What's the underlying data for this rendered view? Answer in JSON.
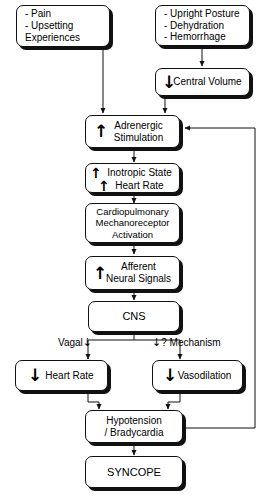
{
  "diagram": {
    "nodes": {
      "triggers": {
        "label": "- Pain\n- Upsetting\n   Experiences"
      },
      "preload": {
        "label": "- Upright Posture\n- Dehydration\n- Hemorrhage"
      },
      "central_volume": {
        "arrow": "↓",
        "label": "Central Volume"
      },
      "adrenergic": {
        "arrow": "↑",
        "label": "Adrenergic\nStimulation"
      },
      "inotropic": {
        "arrow1": "↑",
        "line1": "Inotropic State",
        "arrow2": "↑",
        "line2": "Heart Rate"
      },
      "mechanoreceptor": {
        "label": "Cardiopulmonary\nMechanoreceptor\nActivation"
      },
      "afferent": {
        "arrow": "↑",
        "label": "Afferent\nNeural Signals"
      },
      "cns": {
        "label": "CNS"
      },
      "heart_rate": {
        "arrow": "↓",
        "label": "Heart Rate"
      },
      "vasodilation": {
        "arrow": "↓",
        "label": "Vasodilation"
      },
      "hypotension": {
        "label": "Hypotension\n/ Bradycardia"
      },
      "syncope": {
        "label": "SYNCOPE"
      }
    },
    "edge_labels": {
      "vagal": "Vagal",
      "vagal_arrow": "↓",
      "mechanism_arrow": "↓",
      "mechanism": "? Mechanism"
    },
    "style": {
      "stroke": "#111111",
      "background": "#ffffff"
    }
  }
}
